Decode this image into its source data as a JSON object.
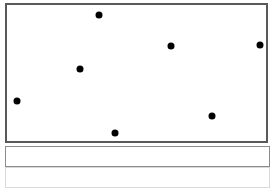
{
  "figure": {
    "title": "",
    "background_color": "#ffffff",
    "width": 274,
    "height": 192
  },
  "plot_panel": {
    "name": "scatter-plot-area",
    "border_color": "#595959",
    "border_width": 2,
    "fill_color": "#ffffff",
    "x": 5,
    "y": 3,
    "width": 263,
    "height": 140
  },
  "lower_bands": [
    {
      "name": "band-upper",
      "label": "",
      "border_color": "#8c8c8c",
      "fill_color": "#ffffff",
      "x": 5,
      "y": 146,
      "width": 265,
      "height": 21
    },
    {
      "name": "band-lower",
      "label": "",
      "border_color": "#d9d9d9",
      "fill_color": "#ffffff",
      "x": 5,
      "y": 167,
      "width": 265,
      "height": 21
    }
  ],
  "chart_data": {
    "type": "scatter",
    "title": "",
    "xlabel": "",
    "ylabel": "",
    "grid": false,
    "legend": null,
    "xlim": [
      0,
      274
    ],
    "ylim": [
      0,
      143
    ],
    "marker": {
      "color": "#000000",
      "shape": "circle",
      "size_px": 7
    },
    "point_count": 7,
    "points": [
      {
        "id": "p1",
        "x": 99,
        "y": 15,
        "size": 7
      },
      {
        "id": "p2",
        "x": 80,
        "y": 69,
        "size": 7
      },
      {
        "id": "p3",
        "x": 17,
        "y": 101,
        "size": 7
      },
      {
        "id": "p4",
        "x": 171,
        "y": 46,
        "size": 7
      },
      {
        "id": "p5",
        "x": 260,
        "y": 45,
        "size": 7
      },
      {
        "id": "p6",
        "x": 212,
        "y": 116,
        "size": 7
      },
      {
        "id": "p7",
        "x": 115,
        "y": 133,
        "size": 7
      }
    ]
  }
}
